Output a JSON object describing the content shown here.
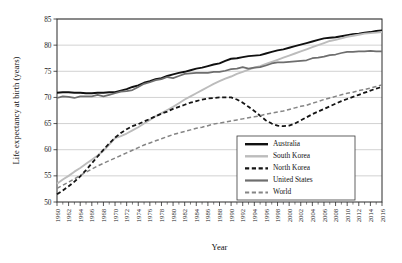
{
  "chart_data": {
    "type": "line",
    "title": "",
    "xlabel": "Year",
    "ylabel": "Life expectancy at birth (years)",
    "xlim": [
      1960,
      2016
    ],
    "ylim": [
      50,
      85
    ],
    "yticks": [
      50,
      55,
      60,
      65,
      70,
      75,
      80,
      85
    ],
    "grid": true,
    "legend_position": "lower-right-inside",
    "x": [
      1960,
      1961,
      1962,
      1963,
      1964,
      1965,
      1966,
      1967,
      1968,
      1969,
      1970,
      1971,
      1972,
      1973,
      1974,
      1975,
      1976,
      1977,
      1978,
      1979,
      1980,
      1981,
      1982,
      1983,
      1984,
      1985,
      1986,
      1987,
      1988,
      1989,
      1990,
      1991,
      1992,
      1993,
      1994,
      1995,
      1996,
      1997,
      1998,
      1999,
      2000,
      2001,
      2002,
      2003,
      2004,
      2005,
      2006,
      2007,
      2008,
      2009,
      2010,
      2011,
      2012,
      2013,
      2014,
      2015,
      2016
    ],
    "xtick_labels": [
      "1960",
      "1962",
      "1964",
      "1966",
      "1968",
      "1970",
      "1972",
      "1974",
      "1976",
      "1978",
      "1980",
      "1982",
      "1984",
      "1986",
      "1988",
      "1990",
      "1992",
      "1994",
      "1996",
      "1998",
      "2000",
      "2002",
      "2004",
      "2006",
      "2008",
      "2010",
      "2012",
      "2014",
      "2016"
    ],
    "xtick_values": [
      1960,
      1962,
      1964,
      1966,
      1968,
      1970,
      1972,
      1974,
      1976,
      1978,
      1980,
      1982,
      1984,
      1986,
      1988,
      1990,
      1992,
      1994,
      1996,
      1998,
      2000,
      2002,
      2004,
      2006,
      2008,
      2010,
      2012,
      2014,
      2016
    ],
    "series": [
      {
        "name": "Australia",
        "color": "#101010",
        "style": "solid",
        "width": 1.9,
        "values": [
          70.9,
          71.0,
          71.0,
          70.9,
          70.9,
          70.8,
          70.8,
          70.9,
          70.9,
          71.0,
          71.0,
          71.3,
          71.6,
          72.0,
          72.3,
          72.8,
          73.1,
          73.5,
          73.7,
          74.1,
          74.4,
          74.7,
          74.9,
          75.2,
          75.5,
          75.7,
          76.0,
          76.3,
          76.5,
          77.0,
          77.4,
          77.5,
          77.7,
          77.9,
          78.0,
          78.1,
          78.4,
          78.7,
          79.0,
          79.2,
          79.5,
          79.8,
          80.1,
          80.4,
          80.7,
          81.0,
          81.3,
          81.4,
          81.5,
          81.7,
          81.9,
          82.1,
          82.2,
          82.4,
          82.5,
          82.7,
          82.8
        ]
      },
      {
        "name": "South Korea",
        "color": "#bcbcbc",
        "style": "solid",
        "width": 1.9,
        "values": [
          53.5,
          54.3,
          55.0,
          55.8,
          56.5,
          57.3,
          58.1,
          58.9,
          59.8,
          61.0,
          62.2,
          62.6,
          63.1,
          63.7,
          64.3,
          65.0,
          65.7,
          66.4,
          67.0,
          67.6,
          68.2,
          68.9,
          69.6,
          70.2,
          70.8,
          71.4,
          72.0,
          72.6,
          73.1,
          73.6,
          74.0,
          74.5,
          74.9,
          75.3,
          75.7,
          76.0,
          76.4,
          76.8,
          77.2,
          77.6,
          78.0,
          78.4,
          78.8,
          79.2,
          79.6,
          80.0,
          80.4,
          80.8,
          81.0,
          81.3,
          81.6,
          81.8,
          82.0,
          82.2,
          82.3,
          82.4,
          82.5
        ]
      },
      {
        "name": "North Korea",
        "color": "#141414",
        "style": "dashed",
        "width": 1.8,
        "values": [
          51.5,
          52.2,
          53.0,
          53.9,
          54.9,
          56.1,
          57.4,
          58.7,
          60.0,
          61.2,
          62.3,
          63.2,
          63.9,
          64.5,
          64.9,
          65.4,
          65.9,
          66.4,
          66.9,
          67.3,
          67.8,
          68.2,
          68.6,
          69.0,
          69.3,
          69.6,
          69.8,
          69.9,
          70.0,
          70.0,
          70.0,
          69.6,
          69.0,
          68.2,
          67.4,
          66.5,
          65.6,
          65.0,
          64.6,
          64.5,
          64.6,
          65.0,
          65.6,
          66.2,
          66.8,
          67.3,
          67.8,
          68.3,
          68.8,
          69.3,
          69.7,
          70.1,
          70.5,
          70.9,
          71.3,
          71.7,
          72.0
        ]
      },
      {
        "name": "United States",
        "color": "#6e6e6e",
        "style": "solid",
        "width": 1.7,
        "values": [
          69.9,
          70.2,
          70.1,
          69.9,
          70.2,
          70.2,
          70.2,
          70.5,
          70.2,
          70.5,
          70.8,
          71.1,
          71.2,
          71.4,
          72.0,
          72.6,
          72.9,
          73.3,
          73.5,
          73.9,
          73.7,
          74.1,
          74.5,
          74.6,
          74.7,
          74.7,
          74.7,
          74.9,
          74.9,
          75.1,
          75.4,
          75.5,
          75.8,
          75.5,
          75.7,
          75.8,
          76.1,
          76.5,
          76.7,
          76.7,
          76.8,
          76.9,
          77.0,
          77.1,
          77.5,
          77.6,
          77.8,
          78.1,
          78.2,
          78.5,
          78.7,
          78.7,
          78.8,
          78.8,
          78.9,
          78.8,
          78.8
        ]
      },
      {
        "name": "World",
        "color": "#858585",
        "style": "dashed",
        "width": 1.5,
        "values": [
          52.6,
          53.2,
          53.8,
          54.4,
          55.1,
          55.7,
          56.3,
          56.9,
          57.4,
          57.9,
          58.4,
          58.9,
          59.4,
          59.9,
          60.4,
          60.9,
          61.3,
          61.7,
          62.1,
          62.5,
          62.9,
          63.2,
          63.5,
          63.8,
          64.1,
          64.3,
          64.6,
          64.9,
          65.1,
          65.3,
          65.5,
          65.7,
          65.9,
          66.1,
          66.3,
          66.5,
          66.8,
          67.0,
          67.2,
          67.4,
          67.7,
          68.0,
          68.3,
          68.5,
          68.9,
          69.2,
          69.6,
          69.9,
          70.2,
          70.5,
          70.8,
          71.0,
          71.3,
          71.5,
          71.8,
          72.1,
          72.4
        ]
      }
    ]
  }
}
